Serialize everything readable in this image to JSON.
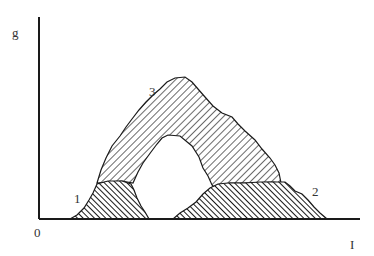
{
  "diagram": {
    "axes": {
      "y_label": "g",
      "x_label": "I",
      "origin_label": "0"
    },
    "regions": [
      {
        "id": "1",
        "label": "1",
        "fill": "dense-hatch",
        "description": "left hump"
      },
      {
        "id": "2",
        "label": "2",
        "fill": "dense-hatch",
        "description": "right plateau"
      },
      {
        "id": "3",
        "label": "3",
        "fill": "light-hatch",
        "description": "arch with central hole"
      }
    ],
    "colors": {
      "line": "#1a1a1a",
      "background": "#ffffff",
      "label": "#333333"
    }
  }
}
